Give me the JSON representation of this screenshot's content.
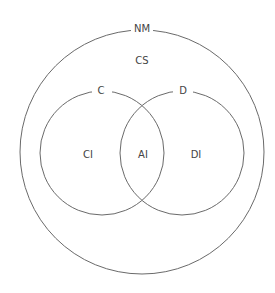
{
  "diagram": {
    "type": "venn",
    "outer": {
      "label": "NM",
      "inner_label": "CS"
    },
    "left": {
      "label": "C",
      "region_label": "CI"
    },
    "right": {
      "label": "D",
      "region_label": "DI"
    },
    "intersection": {
      "label": "AI"
    }
  },
  "colors": {
    "stroke": "#6a6a6a",
    "text": "#444444",
    "background": "#ffffff"
  }
}
